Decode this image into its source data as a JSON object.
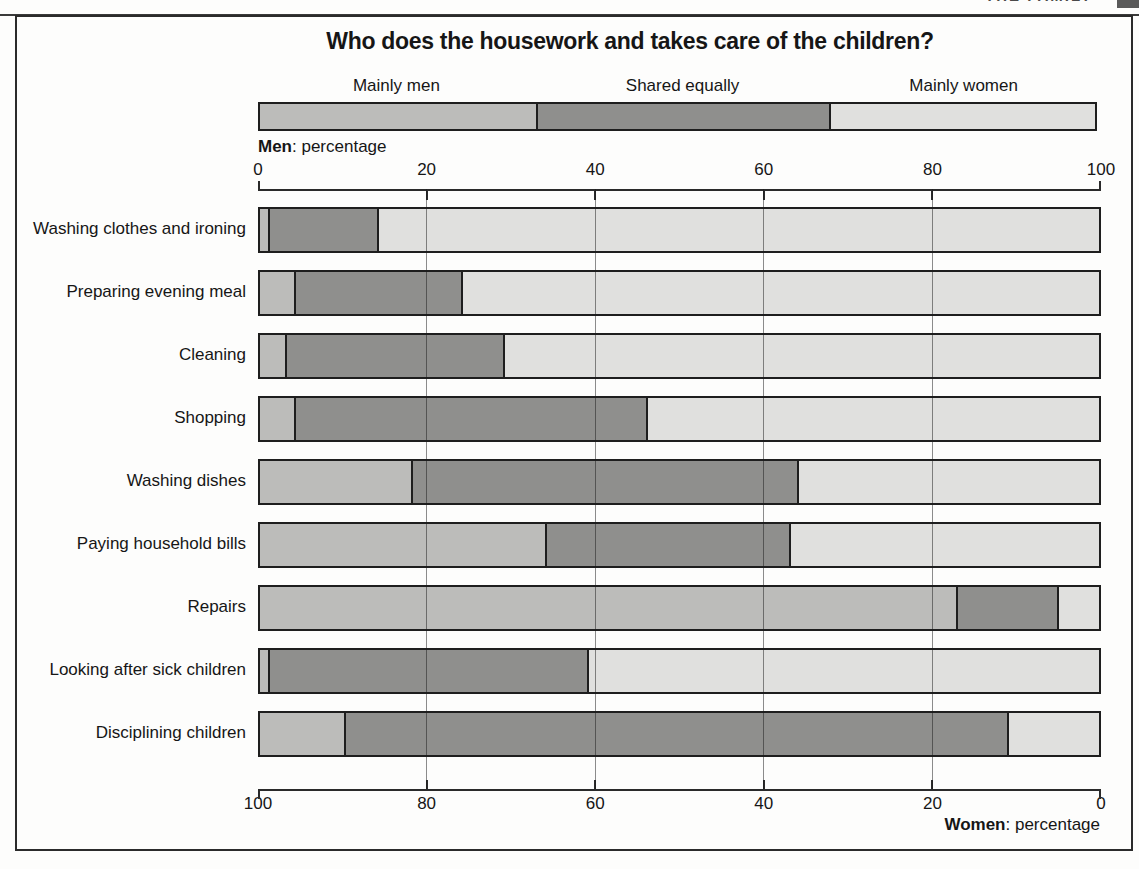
{
  "page": {
    "clipped_header_text": "THE FAMILY"
  },
  "colors": {
    "frame_border": "#2b2b2b",
    "bar_border": "#1e1e1e",
    "gridline": "rgba(25,25,25,0.5)",
    "background": "#fdfdfc"
  },
  "chart_data": {
    "type": "bar",
    "variant": "horizontal-stacked-percentage",
    "title": "Who does the housework and takes care of the children?",
    "legend_position": "top",
    "legend_fractions": [
      0.33,
      0.352,
      0.318
    ],
    "top_axis": {
      "caption_bold": "Men",
      "caption_rest": ": percentage",
      "ticks": [
        "0",
        "20",
        "40",
        "60",
        "80",
        "100"
      ]
    },
    "bottom_axis": {
      "caption_bold": "Women",
      "caption_rest": ": percentage",
      "ticks": [
        "100",
        "80",
        "60",
        "40",
        "20",
        "0"
      ]
    },
    "x_range": [
      0,
      100
    ],
    "grid": true,
    "gridlines_at": [
      20,
      40,
      60,
      80
    ],
    "categories": [
      "Washing clothes and ironing",
      "Preparing evening meal",
      "Cleaning",
      "Shopping",
      "Washing dishes",
      "Paying household bills",
      "Repairs",
      "Looking after sick children",
      "Disciplining children"
    ],
    "series": [
      {
        "name": "Mainly men",
        "color": "#bcbcba",
        "values": [
          1,
          4,
          3,
          4,
          18,
          34,
          83,
          1,
          10
        ]
      },
      {
        "name": "Shared equally",
        "color": "#8f8f8d",
        "values": [
          13,
          20,
          26,
          42,
          46,
          29,
          12,
          38,
          79
        ]
      },
      {
        "name": "Mainly women",
        "color": "#e0e0de",
        "values": [
          86,
          76,
          71,
          54,
          36,
          37,
          5,
          61,
          11
        ]
      }
    ]
  }
}
